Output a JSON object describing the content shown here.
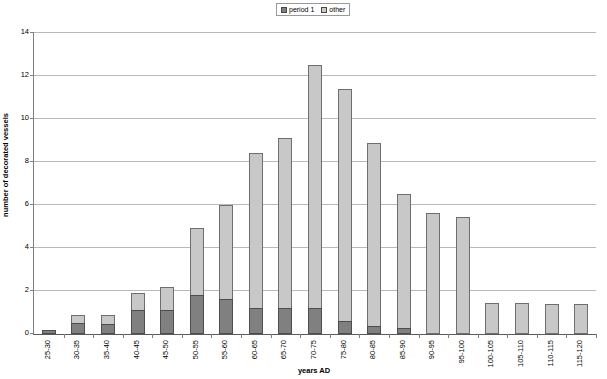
{
  "chart_data": {
    "type": "bar",
    "title": "",
    "xlabel": "years AD",
    "ylabel": "number of decorated vessels",
    "ylim": [
      0,
      14
    ],
    "ytick_step": 2,
    "yticks": [
      0,
      2,
      4,
      6,
      8,
      10,
      12,
      14
    ],
    "grid": true,
    "stacked": true,
    "legend_position": "top-center",
    "categories": [
      "25-30",
      "30-35",
      "35-40",
      "40-45",
      "45-50",
      "50-55",
      "55-60",
      "60-65",
      "65-70",
      "70-75",
      "75-80",
      "80-85",
      "85-90",
      "90-95",
      "95-100",
      "100-105",
      "105-110",
      "110-115",
      "115-120"
    ],
    "series": [
      {
        "name": "period 1",
        "color": "#808080",
        "values": [
          0.2,
          0.5,
          0.45,
          1.1,
          1.1,
          1.8,
          1.65,
          1.2,
          1.2,
          1.2,
          0.6,
          0.35,
          0.3,
          0,
          0,
          0,
          0,
          0,
          0
        ]
      },
      {
        "name": "other",
        "color": "#c8c8c8",
        "values": [
          0,
          0.4,
          0.45,
          0.8,
          1.1,
          3.15,
          4.35,
          7.2,
          7.9,
          11.3,
          10.8,
          8.55,
          6.2,
          5.65,
          5.45,
          1.45,
          1.45,
          1.4,
          1.4
        ]
      }
    ],
    "totals": [
      0.2,
      0.9,
      0.9,
      1.9,
      2.2,
      4.95,
      6.0,
      8.4,
      9.1,
      12.5,
      11.4,
      8.9,
      6.5,
      5.65,
      5.45,
      1.45,
      1.45,
      1.4,
      1.4
    ]
  },
  "legend": {
    "entries": [
      {
        "label": "period 1",
        "swatch": "dark-swatch-icon"
      },
      {
        "label": "other",
        "swatch": "light-swatch-icon"
      }
    ]
  }
}
